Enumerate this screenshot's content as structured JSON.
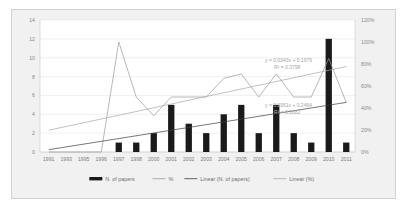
{
  "chart_data": {
    "type": "bar",
    "title": "",
    "subtitle": "",
    "xlabel": "",
    "ylabel": "",
    "y2label": "",
    "categories": [
      "1991",
      "1993",
      "1995",
      "1996",
      "1997",
      "1998",
      "2000",
      "2001",
      "2002",
      "2003",
      "2004",
      "2005",
      "2006",
      "2007",
      "2008",
      "2009",
      "2010",
      "2011"
    ],
    "ylim": [
      0,
      14
    ],
    "yticks": [
      "0",
      "2",
      "4",
      "6",
      "8",
      "10",
      "12",
      "14"
    ],
    "y2lim": [
      0,
      120
    ],
    "y2ticks": [
      "0%",
      "20%",
      "40%",
      "60%",
      "80%",
      "100%",
      "120%"
    ],
    "grid": true,
    "legend_position": "bottom",
    "series": [
      {
        "name": "N. of papers",
        "type": "bar",
        "axis": "left",
        "color": "#1a1a1a",
        "values": [
          0,
          0,
          0,
          0,
          1,
          1,
          2,
          5,
          3,
          2,
          4,
          5,
          2,
          5,
          2,
          1,
          12,
          1
        ]
      },
      {
        "name": "%",
        "type": "line",
        "axis": "right",
        "color": "#9a9a9a",
        "values": [
          0,
          0,
          0,
          0,
          100,
          50,
          33,
          50,
          50,
          50,
          67,
          71,
          50,
          71,
          50,
          50,
          85,
          45
        ]
      },
      {
        "name": "Linear (N. of papers)",
        "type": "trendline",
        "axis": "left",
        "color": "#3d3d3d",
        "equation": "y = 0.2951x + 0.2464",
        "r2": "R² = 0.2882",
        "endpoints": [
          0.2464,
          5.26
        ]
      },
      {
        "name": "Linear (%)",
        "type": "trendline",
        "axis": "right",
        "color": "#a8a8a8",
        "equation": "y = 0.0343x + 0.1979",
        "r2": "R² = 0.3798",
        "endpoints": [
          19.79,
          77.7
        ]
      }
    ],
    "annotations": [
      {
        "text": "y = 0.0343x + 0.1979",
        "for": "Linear (%)"
      },
      {
        "text": "R² = 0.3798",
        "for": "Linear (%)"
      },
      {
        "text": "y = 0.2951x + 0.2464",
        "for": "Linear (N. of papers)"
      },
      {
        "text": "R² = 0.2882",
        "for": "Linear (N. of papers)"
      }
    ]
  },
  "legend": {
    "items": [
      {
        "label": "N. of papers",
        "marker": "bar-swatch"
      },
      {
        "label": "%",
        "marker": "line-swatch"
      },
      {
        "label": "Linear (N. of papers)",
        "marker": "line-swatch"
      },
      {
        "label": "Linear (%)",
        "marker": "line-swatch"
      }
    ]
  }
}
